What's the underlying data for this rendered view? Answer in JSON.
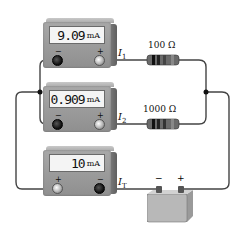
{
  "diagram": {
    "type": "parallel-circuit",
    "meters": [
      {
        "id": "meter-1",
        "reading": "9.09",
        "unit": "mA",
        "label": "I",
        "label_sub": "1",
        "left_terminal": "−",
        "right_terminal": "+"
      },
      {
        "id": "meter-2",
        "reading": "0.909",
        "unit": "mA",
        "label": "I",
        "label_sub": "2",
        "left_terminal": "−",
        "right_terminal": "+"
      },
      {
        "id": "meter-T",
        "reading": "10",
        "unit": "mA",
        "label": "I",
        "label_sub": "T",
        "left_terminal": "+",
        "right_terminal": "−"
      }
    ],
    "resistors": [
      {
        "id": "R1",
        "label": "100 Ω"
      },
      {
        "id": "R2",
        "label": "1000 Ω"
      }
    ],
    "battery": {
      "neg_label": "−",
      "pos_label": "+"
    },
    "colors": {
      "wire": "#444444",
      "meter_body": "#9a9a9a",
      "display_bg": "#f4f4f4",
      "resistor_body": "#555555",
      "battery_body": "#b5b5b5"
    }
  }
}
